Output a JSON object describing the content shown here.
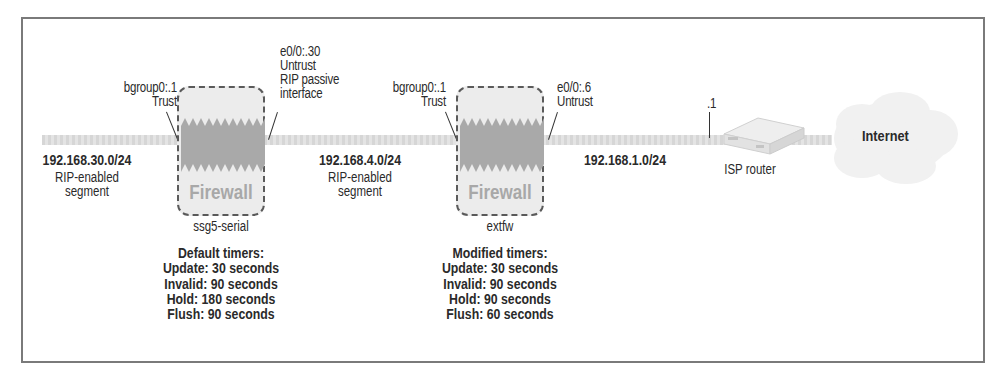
{
  "diagram": {
    "segments": [
      {
        "network": "192.168.30.0/24",
        "description_line1": "RIP-enabled",
        "description_line2": "segment"
      },
      {
        "network": "192.168.4.0/24",
        "description_line1": "RIP-enabled",
        "description_line2": "segment"
      },
      {
        "network": "192.168.1.0/24"
      }
    ],
    "firewalls": [
      {
        "icon_label": "Firewall",
        "name": "ssg5-serial",
        "left_interface": {
          "line1": "bgroup0:.1",
          "line2": "Trust"
        },
        "right_interface": {
          "line1": "e0/0:.30",
          "line2": "Untrust",
          "line3": "RIP passive",
          "line4": "interface"
        },
        "timers": {
          "title": "Default timers:",
          "update": "Update: 30 seconds",
          "invalid": "Invalid: 90 seconds",
          "hold": "Hold: 180 seconds",
          "flush": "Flush: 90 seconds"
        }
      },
      {
        "icon_label": "Firewall",
        "name": "extfw",
        "left_interface": {
          "line1": "bgroup0:.1",
          "line2": "Trust"
        },
        "right_interface": {
          "line1": "e0/0:.6",
          "line2": "Untrust"
        },
        "timers": {
          "title": "Modified timers:",
          "update": "Update: 30 seconds",
          "invalid": "Invalid: 90 seconds",
          "hold": "Hold: 90 seconds",
          "flush": "Flush: 60 seconds"
        }
      }
    ],
    "router": {
      "label": "ISP router",
      "interface": ".1"
    },
    "cloud": {
      "label": "Internet"
    },
    "colors": {
      "frame": "#7a7a7a",
      "segment_line": "#d8d8d8",
      "firewall_fill": "#ececec",
      "firewall_flame": "#a9a9a9",
      "firewall_text": "#a8a8a8",
      "text": "#2a2a2a"
    }
  }
}
